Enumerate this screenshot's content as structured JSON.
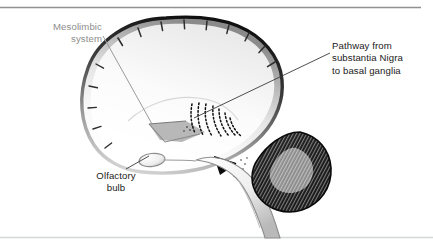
{
  "figure": {
    "background_color": "#ffffff",
    "border_color": "#8f9194",
    "labels": {
      "mesolimbic": {
        "line1": "Mesolimbic",
        "line2": "system",
        "color": "#8d8d8d",
        "align": "right"
      },
      "pathway": {
        "line1": "Pathway from",
        "line2": "substantia Nigra",
        "line3": "to basal ganglia",
        "color": "#1a1a1a",
        "align": "left"
      },
      "olfactory": {
        "line1": "Olfactory",
        "line2": "bulb",
        "color": "#1a1a1a",
        "align": "center"
      }
    },
    "structures": [
      {
        "name": "cerebral-cortex",
        "shading": "gray-gradient-edge"
      },
      {
        "name": "cerebellum",
        "shading": "dark-striped-folia"
      },
      {
        "name": "brainstem",
        "shading": "light-gray"
      },
      {
        "name": "olfactory-bulb",
        "shading": "light-gray-oval"
      },
      {
        "name": "substantia-nigra-wedge",
        "shading": "black"
      },
      {
        "name": "mesolimbic-tract",
        "shading": "gray"
      },
      {
        "name": "dopaminergic-fibers",
        "shading": "dotted-arcs"
      }
    ],
    "leader_lines": [
      {
        "name": "mesolimbic-leader",
        "from": "label-mesolimbic",
        "to": "mesolimbic-tract",
        "color": "#8d8d8d"
      },
      {
        "name": "pathway-leader",
        "from": "label-pathway",
        "to": "dopaminergic-fibers",
        "color": "#3a3a3a"
      },
      {
        "name": "olfactory-leader",
        "from": "label-olfactory",
        "to": "olfactory-bulb",
        "color": "#3a3a3a"
      }
    ]
  }
}
